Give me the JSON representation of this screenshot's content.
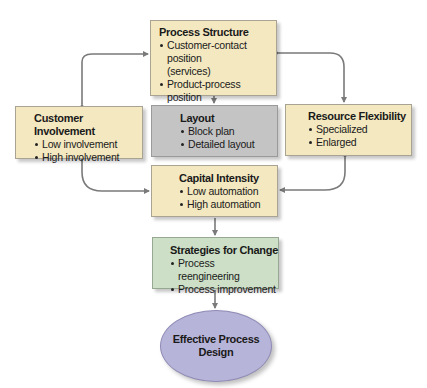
{
  "diagram": {
    "nodes": {
      "process_structure": {
        "title": "Process Structure",
        "items": [
          "Customer-contact position",
          "(services)",
          "Product-process position",
          "(manufacturing)"
        ]
      },
      "customer_involvement": {
        "title": "Customer Involvement",
        "items": [
          "Low involvement",
          "High involvement"
        ]
      },
      "layout": {
        "title": "Layout",
        "items": [
          "Block plan",
          "Detailed layout"
        ]
      },
      "resource_flexibility": {
        "title": "Resource Flexibility",
        "items": [
          "Specialized",
          "Enlarged"
        ]
      },
      "capital_intensity": {
        "title": "Capital Intensity",
        "items": [
          "Low automation",
          "High automation"
        ]
      },
      "strategies_for_change": {
        "title": "Strategies for Change",
        "items": [
          "Process reengineering",
          "Process improvement"
        ]
      },
      "effective_process_design": {
        "line1": "Effective Process",
        "line2": "Design"
      }
    },
    "colors": {
      "decision_box": "#f3e8c0",
      "layout_box": "#c4c4c4",
      "strategy_box": "#cde0c7",
      "outcome_ellipse": "#b7b4d9",
      "arrow": "#7a7a7a"
    }
  }
}
